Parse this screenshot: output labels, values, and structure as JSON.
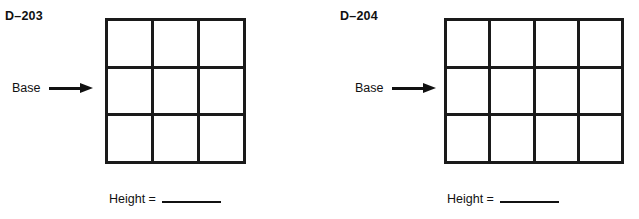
{
  "page": {
    "background_color": "#ffffff",
    "ink_color": "#111111",
    "grid_line_color": "#1a1a1a"
  },
  "figures": [
    {
      "exercise_id": "D–203",
      "base": {
        "label": "Base",
        "arrow_icon": "arrow-right-icon",
        "points_to": "left-edge-of-grid"
      },
      "grid": {
        "columns": 3,
        "rows": 3,
        "total_cells": 9
      },
      "height_prompt": {
        "label": "Height =",
        "answer": ""
      }
    },
    {
      "exercise_id": "D–204",
      "base": {
        "label": "Base",
        "arrow_icon": "arrow-right-icon",
        "points_to": "left-edge-of-grid"
      },
      "grid": {
        "columns": 4,
        "rows": 3,
        "total_cells": 12
      },
      "height_prompt": {
        "label": "Height =",
        "answer": ""
      }
    }
  ]
}
